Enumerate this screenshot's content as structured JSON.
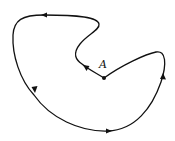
{
  "diagram": {
    "type": "closed-curve-with-orientation",
    "point": {
      "label": "A",
      "x": 104,
      "y": 78
    },
    "label_position": {
      "x": 99,
      "y": 59
    },
    "stroke_color": "#111111",
    "arrows": [
      {
        "name": "top",
        "x": 44,
        "y": 15,
        "direction": "left"
      },
      {
        "name": "left",
        "x": 34,
        "y": 90,
        "direction": "down"
      },
      {
        "name": "bottom",
        "x": 108,
        "y": 130,
        "direction": "right"
      },
      {
        "name": "right",
        "x": 163,
        "y": 76,
        "direction": "up"
      },
      {
        "name": "inner",
        "x": 86,
        "y": 68,
        "direction": "up-left"
      }
    ]
  }
}
